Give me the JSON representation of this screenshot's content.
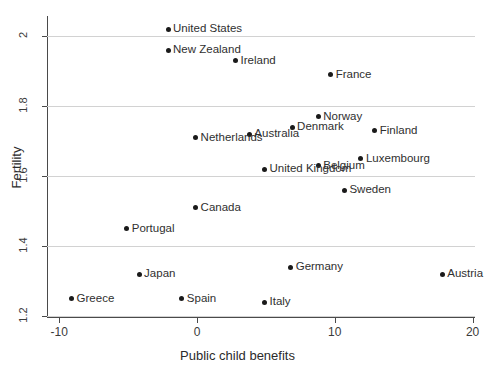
{
  "chart_data": {
    "type": "scatter",
    "title": "",
    "xlabel": "Public child benefits",
    "ylabel": "Fertility",
    "xlim": [
      -10.7,
      20.1
    ],
    "ylim": [
      1.2,
      2.06
    ],
    "xticks": [
      -10,
      0,
      10,
      20
    ],
    "xtick_labels": [
      "-10",
      "0",
      "10",
      "20"
    ],
    "yticks": [
      2,
      1.8,
      1.6,
      1.4,
      1.2
    ],
    "ytick_labels": [
      "2",
      "1.8",
      "1.6",
      "1.4",
      "1.2"
    ],
    "grid": "horizontal",
    "legend": "none",
    "points": [
      {
        "label": "United States",
        "x": -2.1,
        "y": 2.02
      },
      {
        "label": "New Zealand",
        "x": -2.1,
        "y": 1.96
      },
      {
        "label": "Ireland",
        "x": 2.8,
        "y": 1.93
      },
      {
        "label": "France",
        "x": 9.7,
        "y": 1.89
      },
      {
        "label": "Norway",
        "x": 8.8,
        "y": 1.77
      },
      {
        "label": "Denmark",
        "x": 6.9,
        "y": 1.74
      },
      {
        "label": "Australia",
        "x": 3.8,
        "y": 1.72
      },
      {
        "label": "Netherlands",
        "x": -0.1,
        "y": 1.71
      },
      {
        "label": "Finland",
        "x": 12.9,
        "y": 1.73
      },
      {
        "label": "Luxembourg",
        "x": 11.9,
        "y": 1.65
      },
      {
        "label": "Belgium",
        "x": 8.8,
        "y": 1.63
      },
      {
        "label": "United Kingdom",
        "x": 4.9,
        "y": 1.62
      },
      {
        "label": "Sweden",
        "x": 10.7,
        "y": 1.56
      },
      {
        "label": "Canada",
        "x": -0.1,
        "y": 1.51
      },
      {
        "label": "Portugal",
        "x": -5.1,
        "y": 1.45
      },
      {
        "label": "Germany",
        "x": 6.8,
        "y": 1.34
      },
      {
        "label": "Austria",
        "x": 17.8,
        "y": 1.32
      },
      {
        "label": "Japan",
        "x": -4.2,
        "y": 1.32
      },
      {
        "label": "Spain",
        "x": -1.1,
        "y": 1.25
      },
      {
        "label": "Italy",
        "x": 4.9,
        "y": 1.24
      },
      {
        "label": "Greece",
        "x": -9.1,
        "y": 1.25
      }
    ]
  }
}
